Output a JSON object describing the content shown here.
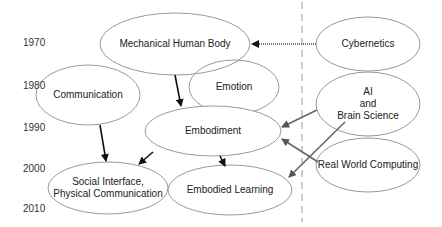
{
  "diagram": {
    "timeline": {
      "years": [
        {
          "label": "1970",
          "y": 44
        },
        {
          "label": "1980",
          "y": 88
        },
        {
          "label": "1990",
          "y": 128
        },
        {
          "label": "2000",
          "y": 170
        },
        {
          "label": "2010",
          "y": 208
        }
      ]
    },
    "divider": {
      "style": "dashed",
      "x": 302
    },
    "nodes": [
      {
        "id": "mechanical",
        "label": "Mechanical Human Body",
        "cx": 175,
        "cy": 44,
        "rx": 75,
        "ry": 31
      },
      {
        "id": "communication",
        "label": "Communication",
        "cx": 88,
        "cy": 95,
        "rx": 52,
        "ry": 30
      },
      {
        "id": "emotion",
        "label": "Emotion",
        "cx": 234,
        "cy": 87,
        "rx": 45,
        "ry": 27
      },
      {
        "id": "embodiment",
        "label": "Embodiment",
        "cx": 213,
        "cy": 131,
        "rx": 68,
        "ry": 25
      },
      {
        "id": "social",
        "label": "Social Interface,\nPhysical Communication",
        "line1": "Social Interface,",
        "line2": "Physical Communication",
        "cx": 108,
        "cy": 188,
        "rx": 60,
        "ry": 26
      },
      {
        "id": "embodied_learning",
        "label": "Embodied Learning",
        "cx": 230,
        "cy": 190,
        "rx": 62,
        "ry": 25
      },
      {
        "id": "cybernetics",
        "label": "Cybernetics",
        "cx": 368,
        "cy": 44,
        "rx": 52,
        "ry": 27
      },
      {
        "id": "ai",
        "label": "AI\nand\nBrain Science",
        "line1": "AI",
        "line2": "and",
        "line3": "Brain Science",
        "cx": 368,
        "cy": 104,
        "rx": 52,
        "ry": 32
      },
      {
        "id": "rwc",
        "label": "Real World Computing",
        "cx": 368,
        "cy": 165,
        "rx": 52,
        "ry": 27
      }
    ],
    "edges": [
      {
        "from": "cybernetics",
        "to": "mechanical",
        "style": "gray-dotted"
      },
      {
        "from": "mechanical",
        "to": "embodiment",
        "style": "black"
      },
      {
        "from": "communication",
        "to": "social",
        "style": "black"
      },
      {
        "from": "embodiment",
        "to": "social",
        "style": "black"
      },
      {
        "from": "embodiment",
        "to": "embodied_learning",
        "style": "black"
      },
      {
        "from": "ai",
        "to": "embodiment",
        "style": "gray"
      },
      {
        "from": "ai",
        "to": "embodied_learning",
        "style": "gray"
      },
      {
        "from": "rwc",
        "to": "embodiment",
        "style": "gray"
      }
    ],
    "colors": {
      "ellipse_stroke": "#999999",
      "arrow_black": "#111111",
      "arrow_gray": "#666666",
      "divider": "#999999",
      "text": "#222222"
    }
  }
}
